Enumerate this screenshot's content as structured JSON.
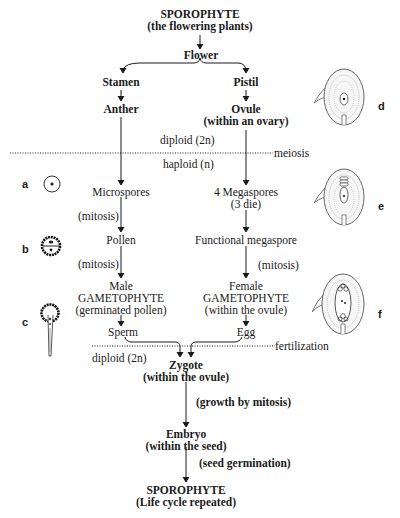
{
  "title": {
    "line1": "SPOROPHYTE",
    "line2": "(the flowering plants)"
  },
  "flower": "Flower",
  "left_branch": {
    "stamen": "Stamen",
    "anther": "Anther",
    "microspores": "Microspores",
    "mitosis1": "(mitosis)",
    "pollen": "Pollen",
    "mitosis2": "(mitosis)",
    "male_line1": "Male",
    "male_line2": "GAMETOPHYTE",
    "male_line3": "(germinated pollen)",
    "sperm": "Sperm"
  },
  "right_branch": {
    "pistil": "Pistil",
    "ovule_line1": "Ovule",
    "ovule_line2": "(within an ovary)",
    "megaspores_line1": "4 Megaspores",
    "megaspores_line2": "(3 die)",
    "functional": "Functional megaspore",
    "mitosis": "(mitosis)",
    "female_line1": "Female",
    "female_line2": "GAMETOPHYTE",
    "female_line3": "(within the ovule)",
    "egg": "Egg"
  },
  "ploidy": {
    "diploid_top": "diploid (2n)",
    "haploid": "haploid (n)",
    "meiosis": "meiosis",
    "fertilization": "fertilization",
    "diploid_bottom": "diploid (2n)"
  },
  "bottom": {
    "zygote_line1": "Zygote",
    "zygote_line2": "(within the ovule)",
    "growth": "(growth by mitosis)",
    "embryo_line1": "Embryo",
    "embryo_line2": "(within the seed)",
    "germination": "(seed germination)",
    "sporophyte_line1": "SPOROPHYTE",
    "sporophyte_line2": "(Life cycle repeated)"
  },
  "figure_labels": {
    "a": "a",
    "b": "b",
    "c": "c",
    "d": "d",
    "e": "e",
    "f": "f"
  },
  "icons": {
    "a": "microspore-cell-icon",
    "b": "pollen-grain-icon",
    "c": "germinated-pollen-icon",
    "d": "ovule-icon",
    "e": "ovule-megaspores-icon",
    "f": "ovule-embryo-sac-icon"
  }
}
